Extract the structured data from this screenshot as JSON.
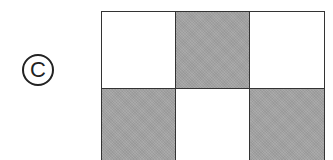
{
  "label": {
    "text": "C",
    "style": "circled"
  },
  "grid": {
    "rows": 2,
    "cols": 3,
    "cells": [
      [
        "white",
        "shaded",
        "white"
      ],
      [
        "shaded",
        "white",
        "shaded"
      ]
    ],
    "colors": {
      "shaded": "#a3a3a3",
      "white": "#ffffff",
      "border": "#333333"
    }
  }
}
